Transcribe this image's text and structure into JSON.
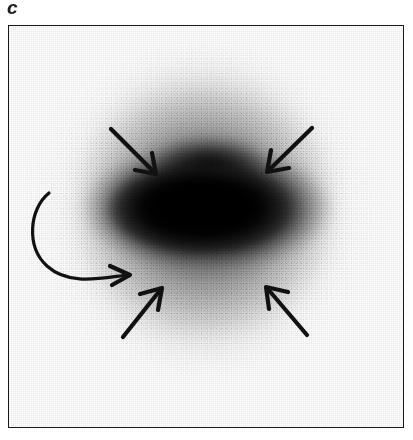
{
  "figure": {
    "panel_label": "c",
    "image_type": "grayscale-scintigram",
    "frame": {
      "x": 8,
      "y": 25,
      "width": 396,
      "height": 403,
      "border_color": "#191919",
      "border_width_px": 1.5,
      "background": "#ffffff"
    }
  },
  "scan": {
    "description": "Diffuse grainy grayscale distribution with a dense dark horizontally-elongated core surrounded by a fainter round halo",
    "core": {
      "center_x": 197,
      "center_y": 182,
      "width": 252,
      "height": 128,
      "peak_color": "#000000"
    },
    "halo": {
      "center_x": 195,
      "center_y": 183,
      "width": 300,
      "height": 330,
      "edge_color": "#b8b8b8"
    }
  },
  "annotations": {
    "color": "#111111",
    "arrows": [
      {
        "name": "arrow-upper-left",
        "direction": "down-right",
        "tail_x": 102,
        "tail_y": 103,
        "tip_x": 146,
        "tip_y": 147
      },
      {
        "name": "arrow-upper-right",
        "direction": "down-left",
        "tail_x": 303,
        "tail_y": 102,
        "tip_x": 259,
        "tip_y": 145
      },
      {
        "name": "arrow-lower-left",
        "direction": "up-right",
        "tail_x": 114,
        "tail_y": 311,
        "tip_x": 152,
        "tip_y": 263
      },
      {
        "name": "arrow-lower-right",
        "direction": "up-left",
        "tail_x": 298,
        "tail_y": 309,
        "tip_x": 258,
        "tip_y": 262
      }
    ],
    "curved_arrow": {
      "name": "curved-arrow-left",
      "direction": "right",
      "start_x": 40,
      "start_y": 167,
      "tip_x": 119,
      "tip_y": 249
    }
  }
}
